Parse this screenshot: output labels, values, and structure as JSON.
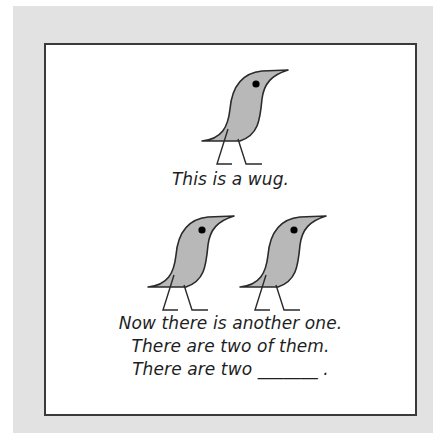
{
  "figure": {
    "top_panel": {
      "caption": "This is a wug.",
      "creatures": [
        {
          "name": "wug",
          "icon": "wug-bird-icon"
        }
      ]
    },
    "bottom_panel": {
      "creatures": [
        {
          "name": "wug",
          "icon": "wug-bird-icon"
        },
        {
          "name": "wug",
          "icon": "wug-bird-icon"
        }
      ],
      "lines": [
        "Now there is another one.",
        "There are two of them.",
        "There are two _______ ."
      ]
    },
    "colors": {
      "mat": "#e2e2e2",
      "card_border": "#3a3a3a",
      "bird_fill": "#b8b8b8",
      "bird_stroke": "#2a2a2a",
      "eye": "#000000"
    }
  }
}
